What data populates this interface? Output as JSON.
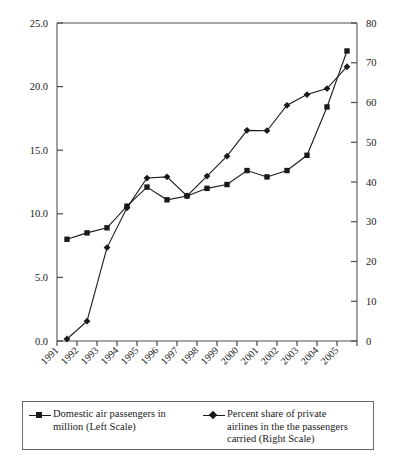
{
  "chart_data": {
    "type": "line",
    "title": "",
    "subtitle": "",
    "xlabel": "",
    "ylabel": "",
    "y2label": "",
    "grid": false,
    "legend_position": "bottom",
    "categories": [
      "1991",
      "1992",
      "1993",
      "1994",
      "1995",
      "1996",
      "1997",
      "1998",
      "1999",
      "2000",
      "2001",
      "2002",
      "2003",
      "2004",
      "2005"
    ],
    "ylim": [
      0,
      25
    ],
    "yticks": [
      "0.0",
      "5.0",
      "10.0",
      "15.0",
      "20.0",
      "25.0"
    ],
    "ytick_values": [
      0,
      5,
      10,
      15,
      20,
      25
    ],
    "y2lim": [
      0,
      80
    ],
    "y2ticks": [
      "0",
      "10",
      "20",
      "30",
      "40",
      "50",
      "60",
      "70",
      "80"
    ],
    "y2tick_values": [
      0,
      10,
      20,
      30,
      40,
      50,
      60,
      70,
      80
    ],
    "series": [
      {
        "name": "Domestic air passengers in million (Left Scale)",
        "axis": "left",
        "marker": "square",
        "color": "#1a1a1a",
        "values": [
          8.0,
          8.5,
          8.9,
          10.6,
          12.1,
          11.1,
          11.4,
          12.0,
          12.3,
          13.4,
          12.9,
          13.4,
          14.6,
          18.4,
          22.8
        ]
      },
      {
        "name": "Percent share of private airlines in the the passengers carried (Right Scale)",
        "axis": "right",
        "marker": "diamond",
        "color": "#1a1a1a",
        "values": [
          0.5,
          5.0,
          23.5,
          33.5,
          41.0,
          41.3,
          36.5,
          41.5,
          46.5,
          53.0,
          52.9,
          59.3,
          62.0,
          63.5,
          69.0
        ]
      }
    ]
  },
  "legend": {
    "entries": [
      {
        "marker": "square",
        "line1": "Domestic air passengers in",
        "line2": "million (Left Scale)",
        "line3": ""
      },
      {
        "marker": "diamond",
        "line1": "Percent share of private",
        "line2": "airlines in the the passengers",
        "line3": "carried (Right Scale)"
      }
    ]
  }
}
